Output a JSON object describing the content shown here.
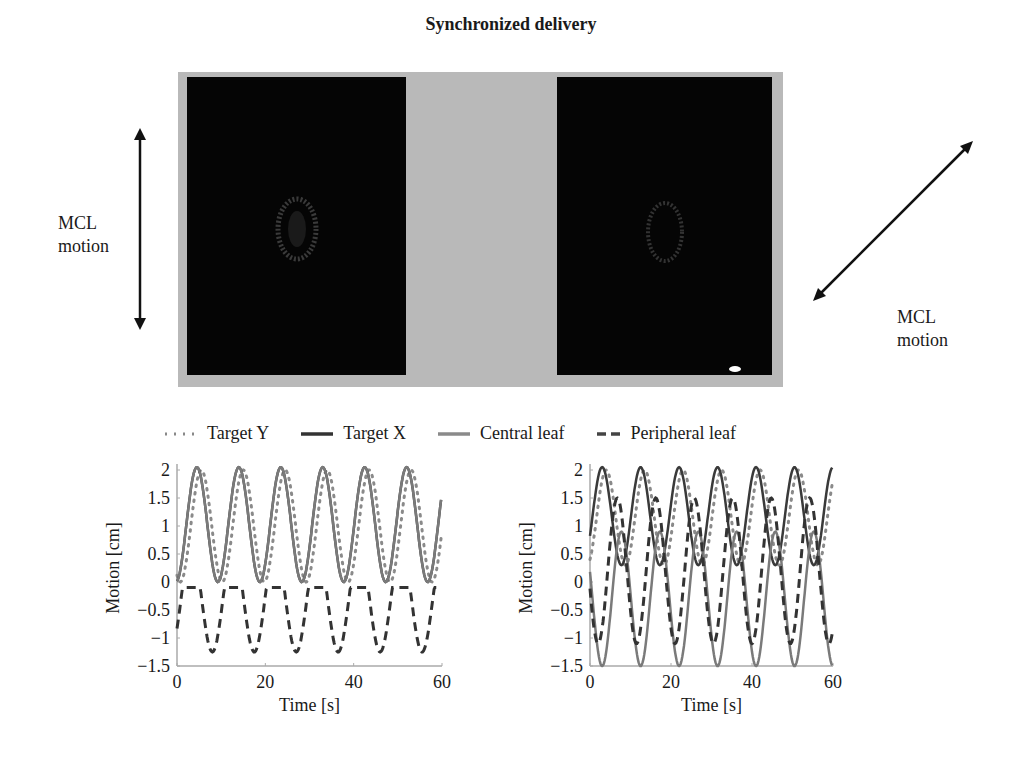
{
  "title": "Synchronized delivery",
  "labels": {
    "left_motion": [
      "MCL",
      "motion"
    ],
    "right_motion": [
      "MCL",
      "motion"
    ]
  },
  "images": [
    {
      "name": "dose-map-vertical",
      "arrow": "vertical"
    },
    {
      "name": "dose-map-diagonal",
      "arrow": "diagonal"
    }
  ],
  "legend": [
    {
      "label": "Target Y",
      "style": "dotted"
    },
    {
      "label": "Target X",
      "style": "solid-dark"
    },
    {
      "label": "Central leaf",
      "style": "solid-gray"
    },
    {
      "label": "Peripheral leaf",
      "style": "dashed"
    }
  ],
  "chart_data": [
    {
      "type": "line",
      "title": "",
      "xlabel": "Time [s]",
      "ylabel": "Motion [cm]",
      "xlim": [
        0,
        60
      ],
      "ylim": [
        -1.5,
        2
      ],
      "xticks": [
        0,
        20,
        40,
        60
      ],
      "yticks": [
        -1.5,
        -1,
        -0.5,
        0,
        0.5,
        1,
        1.5,
        2
      ],
      "grid": false,
      "period_s": 9.5,
      "series": [
        {
          "name": "Target Y",
          "amplitude_range": [
            0,
            2
          ],
          "peaks_at_s": [
            5.5,
            15,
            24.5,
            34,
            43.5,
            53
          ]
        },
        {
          "name": "Target X",
          "amplitude_range": [
            0,
            2.05
          ],
          "peaks_at_s": [
            4.5,
            14,
            23.5,
            33,
            42.5,
            52
          ]
        },
        {
          "name": "Central leaf",
          "amplitude_range": [
            0,
            2.05
          ],
          "peaks_at_s": [
            4.5,
            14,
            23.5,
            33,
            42.5,
            52
          ]
        },
        {
          "name": "Peripheral leaf",
          "amplitude_range": [
            -1.25,
            0.6
          ],
          "troughs_at_s": [
            8,
            17.5,
            27,
            36.5,
            46,
            55.5
          ]
        }
      ]
    },
    {
      "type": "line",
      "title": "",
      "xlabel": "Time [s]",
      "ylabel": "Motion [cm]",
      "xlim": [
        0,
        60
      ],
      "ylim": [
        -1.5,
        2
      ],
      "xticks": [
        0,
        20,
        40,
        60
      ],
      "yticks": [
        -1.5,
        -1,
        -0.5,
        0,
        0.5,
        1,
        1.5,
        2
      ],
      "grid": false,
      "period_s": 9.5,
      "series": [
        {
          "name": "Target Y",
          "amplitude_range": [
            0.3,
            2
          ],
          "peaks_at_s": [
            4,
            13.5,
            23,
            32.5,
            42,
            51.5
          ]
        },
        {
          "name": "Target X",
          "amplitude_range": [
            0.3,
            2.05
          ],
          "peaks_at_s": [
            3,
            12.5,
            22,
            31.5,
            41,
            50.5,
            60
          ]
        },
        {
          "name": "Central leaf",
          "amplitude_range": [
            -1.5,
            0.9
          ],
          "troughs_at_s": [
            3,
            12.5,
            22,
            31.5,
            41,
            50.5,
            60
          ]
        },
        {
          "name": "Peripheral leaf",
          "amplitude_range": [
            -1.1,
            1.5
          ],
          "troughs_at_s": [
            2,
            11.5,
            21,
            30.5,
            40,
            49.5,
            59
          ]
        }
      ]
    }
  ]
}
